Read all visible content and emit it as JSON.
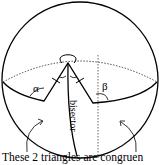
{
  "diagram": {
    "labels": {
      "alpha": "α",
      "beta": "β",
      "bisector": "bisector"
    },
    "caption": "These 2 triangles are congruen"
  }
}
